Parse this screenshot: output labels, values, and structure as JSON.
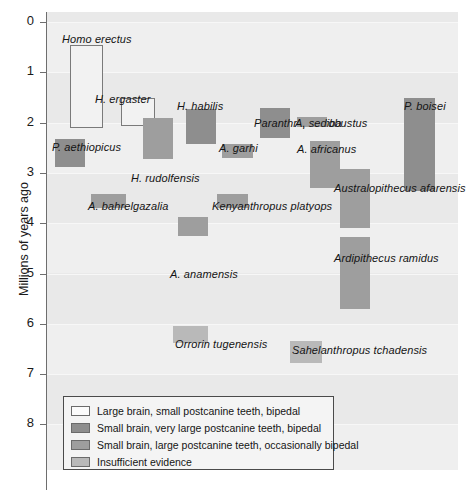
{
  "chart_data": {
    "type": "bar",
    "orientation": "vertical-ranges",
    "title": "",
    "xlabel": "",
    "ylabel": "Millions of years ago",
    "ylim": [
      0,
      8
    ],
    "y_inverted": true,
    "yticks": [
      0,
      1,
      2,
      3,
      4,
      5,
      6,
      7,
      8
    ],
    "ytick_labels": [
      "0",
      "1",
      "2",
      "3",
      "4",
      "5",
      "6",
      "7",
      "8"
    ],
    "grid": true,
    "legend_position": "bottom-left-inside",
    "categories": [
      "Large brain, small postcanine teeth, bipedal",
      "Small brain, very large postcanine teeth, bipedal",
      "Small brain, large postcanine teeth, occasionally bipedal",
      "Insufficient evidence"
    ],
    "category_colors": [
      "#f2f2f2",
      "#8e8e8e",
      "#9e9e9e",
      "#b9b9b9"
    ],
    "bars": [
      {
        "name": "Homo erectus",
        "label": "Homo erectus",
        "y_start": 0.45,
        "y_end": 2.1,
        "x_left": 70,
        "x_width": 33,
        "category": "large-brain",
        "label_x": 62,
        "label_y": 33,
        "label_align": "left"
      },
      {
        "name": "H. ergaster",
        "label": "H. ergaster",
        "y_start": 1.52,
        "y_end": 2.07,
        "x_left": 121,
        "x_width": 34,
        "category": "large-brain",
        "label_x": 95,
        "label_y": 93,
        "label_align": "left"
      },
      {
        "name": "P. aethiopicus",
        "label": "P. aethiopicus",
        "y_start": 2.33,
        "y_end": 2.88,
        "x_left": 55,
        "x_width": 30,
        "category": "very-large",
        "label_x": 52,
        "label_y": 141,
        "label_align": "left"
      },
      {
        "name": "H. rudolfensis",
        "label": "H. rudolfensis",
        "y_start": 1.9,
        "y_end": 2.72,
        "x_left": 143,
        "x_width": 30,
        "category": "large",
        "label_x": 131,
        "label_y": 172,
        "label_align": "left"
      },
      {
        "name": "H. habilis",
        "label": "H. habilis",
        "y_start": 1.72,
        "y_end": 2.42,
        "x_left": 186,
        "x_width": 30,
        "category": "very-large",
        "label_x": 177,
        "label_y": 100,
        "label_align": "left"
      },
      {
        "name": "A. garhi",
        "label": "A. garhi",
        "y_start": 2.42,
        "y_end": 2.7,
        "x_left": 222,
        "x_width": 31,
        "category": "large",
        "label_x": 219,
        "label_y": 142,
        "label_align": "left"
      },
      {
        "name": "Paranthropus robustus",
        "label": "Paranthropus robustus",
        "y_start": 1.7,
        "y_end": 2.3,
        "x_left": 260,
        "x_width": 30,
        "category": "very-large",
        "label_x": 254,
        "label_y": 117,
        "label_align": "left"
      },
      {
        "name": "A. sediba",
        "label": "A. sediba",
        "y_start": 1.88,
        "y_end": 2.08,
        "x_left": 297,
        "x_width": 30,
        "category": "large",
        "label_x": 295,
        "label_y": 117,
        "label_align": "left"
      },
      {
        "name": "A. africanus",
        "label": "A. africanus",
        "y_start": 2.37,
        "y_end": 3.3,
        "x_left": 310,
        "x_width": 30,
        "category": "large",
        "label_x": 297,
        "label_y": 143,
        "label_align": "left"
      },
      {
        "name": "P. boisei",
        "label": "P. boisei",
        "y_start": 1.52,
        "y_end": 3.35,
        "x_left": 404,
        "x_width": 31,
        "category": "very-large",
        "label_x": 404,
        "label_y": 100,
        "label_align": "left"
      },
      {
        "name": "A. bahrelgazalia",
        "label": "A. bahrelgazalia",
        "y_start": 3.42,
        "y_end": 3.7,
        "x_left": 91,
        "x_width": 35,
        "category": "large",
        "label_x": 88,
        "label_y": 200,
        "label_align": "left"
      },
      {
        "name": "Kenyanthropus platyops",
        "label": "Kenyanthropus platyops",
        "y_start": 3.42,
        "y_end": 3.7,
        "x_left": 217,
        "x_width": 31,
        "category": "large",
        "label_x": 212,
        "label_y": 200,
        "label_align": "left"
      },
      {
        "name": "A. anamensis",
        "label": "A. anamensis",
        "y_start": 3.88,
        "y_end": 4.25,
        "x_left": 178,
        "x_width": 30,
        "category": "large",
        "label_x": 170,
        "label_y": 268,
        "label_align": "left"
      },
      {
        "name": "Australopithecus afarensis",
        "label": "Australopithecus afarensis",
        "y_start": 2.92,
        "y_end": 4.1,
        "x_left": 340,
        "x_width": 30,
        "category": "large",
        "label_x": 334,
        "label_y": 182,
        "label_align": "left"
      },
      {
        "name": "Ardipithecus ramidus",
        "label": "Ardipithecus ramidus",
        "y_start": 4.28,
        "y_end": 5.7,
        "x_left": 340,
        "x_width": 30,
        "category": "large",
        "label_x": 334,
        "label_y": 252,
        "label_align": "left"
      },
      {
        "name": "Orrorin tugenensis",
        "label": "Orrorin tugenensis",
        "y_start": 6.05,
        "y_end": 6.38,
        "x_left": 173,
        "x_width": 35,
        "category": "insufficient",
        "label_x": 175,
        "label_y": 338,
        "label_align": "left"
      },
      {
        "name": "Sahelanthropus tchadensis",
        "label": "Sahelanthropus tchadensis",
        "y_start": 6.35,
        "y_end": 6.78,
        "x_left": 290,
        "x_width": 32,
        "category": "insufficient",
        "label_x": 292,
        "label_y": 344,
        "label_align": "left"
      }
    ]
  },
  "axis": {
    "y_title": "Millions of years ago",
    "ticks": [
      "0",
      "1",
      "2",
      "3",
      "4",
      "5",
      "6",
      "7",
      "8"
    ]
  },
  "legend": {
    "items": [
      {
        "label": "Large brain, small postcanine teeth, bipedal",
        "swatch": "c-large-brain",
        "name": "legend-swatch-large-brain"
      },
      {
        "label": "Small brain, very large postcanine teeth, bipedal",
        "swatch": "c-very-large",
        "name": "legend-swatch-very-large-postcanine"
      },
      {
        "label": "Small brain, large postcanine teeth, occasionally bipedal",
        "swatch": "c-large",
        "name": "legend-swatch-large-postcanine"
      },
      {
        "label": "Insufficient evidence",
        "swatch": "c-insufficient",
        "name": "legend-swatch-insufficient-evidence"
      }
    ]
  }
}
